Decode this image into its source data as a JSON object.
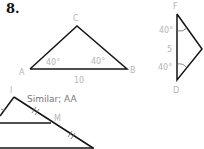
{
  "problem_number": "8.",
  "triangle_abc": {
    "vertices": {
      "A": "A",
      "B": "B",
      "C": "C"
    },
    "angle_a": "40°",
    "angle_b": "40°",
    "side_ab": "10"
  },
  "triangle_def": {
    "vertices": {
      "F": "F",
      "D": "D"
    },
    "angle_f": "40°",
    "angle_d": "40°",
    "side_fd": "5"
  },
  "answer": "Similar; AA",
  "next_figure": {
    "vertices": {
      "top": "I",
      "mid": "M"
    }
  }
}
